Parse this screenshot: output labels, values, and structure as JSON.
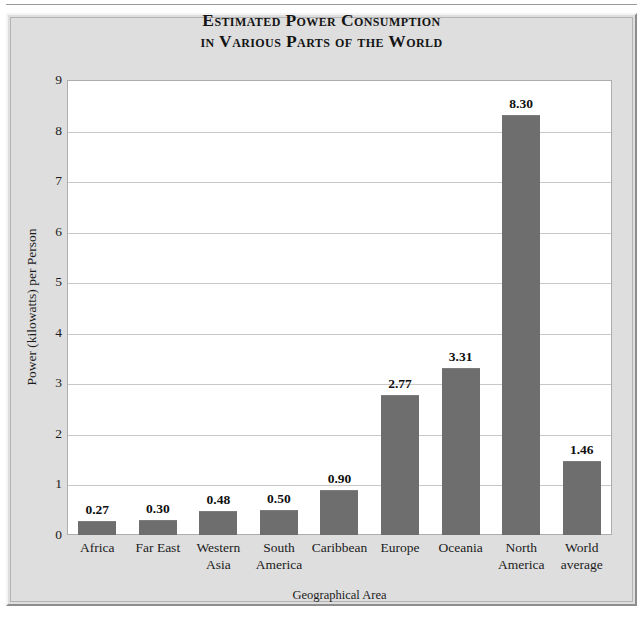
{
  "chart_data": {
    "type": "bar",
    "title": "Estimated Power Consumption in Various Parts of the World",
    "title_line1": "Estimated Power Consumption",
    "title_line2": "in Various Parts of the World",
    "xlabel": "Geographical Area",
    "ylabel": "Power (kilowatts) per Person",
    "categories": [
      "Africa",
      "Far East",
      "Western Asia",
      "South America",
      "Caribbean",
      "Europe",
      "Oceania",
      "North America",
      "World average"
    ],
    "category_lines": [
      [
        "Africa"
      ],
      [
        "Far East"
      ],
      [
        "Western",
        "Asia"
      ],
      [
        "South",
        "America"
      ],
      [
        "Caribbean"
      ],
      [
        "Europe"
      ],
      [
        "Oceania"
      ],
      [
        "North",
        "America"
      ],
      [
        "World",
        "average"
      ]
    ],
    "values": [
      0.27,
      0.3,
      0.48,
      0.5,
      0.9,
      2.77,
      3.31,
      8.3,
      1.46
    ],
    "value_labels": [
      "0.27",
      "0.30",
      "0.48",
      "0.50",
      "0.90",
      "2.77",
      "3.31",
      "8.30",
      "1.46"
    ],
    "ylim": [
      0,
      9
    ],
    "yticks": [
      0,
      1,
      2,
      3,
      4,
      5,
      6,
      7,
      8,
      9
    ],
    "ytick_labels": [
      "0",
      "1",
      "2",
      "3",
      "4",
      "5",
      "6",
      "7",
      "8",
      "9"
    ],
    "grid": true,
    "grid_axis": "y",
    "legend": null,
    "bar_color": "#6E6E6E",
    "plot_background": "#FFFFFF",
    "panel_background": "#DEDEDE",
    "gridline_color": "#C8C8C8",
    "text_color": "#1B1B1B"
  }
}
